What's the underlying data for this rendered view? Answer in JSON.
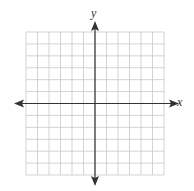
{
  "diagram": {
    "type": "coordinate-plane",
    "axes": {
      "x_label": "x",
      "y_label": "y",
      "arrows": "both-ends"
    },
    "grid": {
      "columns": 12,
      "rows": 12,
      "origin_column": 6,
      "origin_row": 6
    },
    "colors": {
      "grid_line": "#c8c8c8",
      "axis": "#333333",
      "background": "#ffffff"
    }
  }
}
